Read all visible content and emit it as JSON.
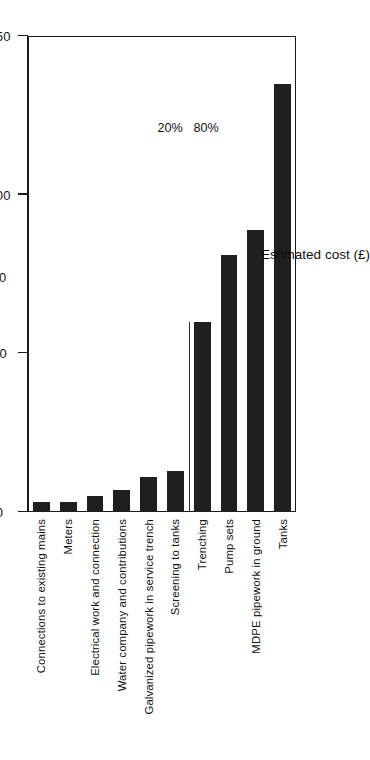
{
  "chart_data": {
    "type": "bar",
    "orientation": "horizontal",
    "title": "",
    "xlabel": "Estimated cost (£)",
    "unit_label": "000",
    "ylabel": "",
    "xlim": [
      0,
      150
    ],
    "grid": false,
    "legend": false,
    "ticks": [
      "0",
      "50",
      "100",
      "150"
    ],
    "tick_values": [
      0,
      50,
      100,
      150
    ],
    "categories": [
      "Connections to existing mains",
      "Meters",
      "Electrical work and connection",
      "Water company and contributions",
      "Galvanized pipework in service trench",
      "Screening to tanks",
      "Trenching",
      "Pump sets",
      "MDPE pipework in ground",
      "Tanks"
    ],
    "values": [
      3,
      3,
      5,
      7,
      11,
      13,
      60,
      81,
      89,
      135
    ],
    "annotations": [
      {
        "label": "20%",
        "index": 0
      },
      {
        "label": "80%",
        "index": 1
      }
    ],
    "bar_color": "#201f1f",
    "axis_color": "#1a1a1a"
  }
}
